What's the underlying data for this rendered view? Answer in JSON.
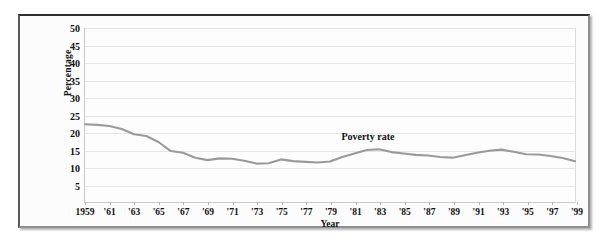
{
  "chart_data": {
    "type": "line",
    "title": "",
    "xlabel": "Year",
    "ylabel": "Percentage",
    "xlim": [
      1959,
      1999
    ],
    "ylim": [
      0,
      50
    ],
    "grid": true,
    "legend_position": "none",
    "line_color": "#9a9a9a",
    "annotations": [
      {
        "text": "Poverty rate",
        "x": 1982,
        "y": 18.5
      }
    ],
    "ytick_labels": [
      "5",
      "10",
      "15",
      "20",
      "25",
      "30",
      "35",
      "40",
      "45",
      "50"
    ],
    "yticks": [
      5,
      10,
      15,
      20,
      25,
      30,
      35,
      40,
      45,
      50
    ],
    "xtick_labels": [
      "1959",
      "'61",
      "'63",
      "'65",
      "'67",
      "'69",
      "'71",
      "'73",
      "'75",
      "'77",
      "'79",
      "'81",
      "'83",
      "'85",
      "'87",
      "'89",
      "'91",
      "'93",
      "'95",
      "'97",
      "'99"
    ],
    "xticks": [
      1959,
      1961,
      1963,
      1965,
      1967,
      1969,
      1971,
      1973,
      1975,
      1977,
      1979,
      1981,
      1983,
      1985,
      1987,
      1989,
      1991,
      1993,
      1995,
      1997,
      1999
    ],
    "series": [
      {
        "name": "Poverty rate",
        "x": [
          1959,
          1960,
          1961,
          1962,
          1963,
          1964,
          1965,
          1966,
          1967,
          1968,
          1969,
          1970,
          1971,
          1972,
          1973,
          1974,
          1975,
          1976,
          1977,
          1978,
          1979,
          1980,
          1981,
          1982,
          1983,
          1984,
          1985,
          1986,
          1987,
          1988,
          1989,
          1990,
          1991,
          1992,
          1993,
          1994,
          1995,
          1996,
          1997,
          1998,
          1999
        ],
        "values": [
          22.4,
          22.2,
          21.9,
          21.0,
          19.5,
          19.0,
          17.3,
          14.7,
          14.2,
          12.8,
          12.1,
          12.6,
          12.5,
          11.9,
          11.1,
          11.2,
          12.3,
          11.8,
          11.6,
          11.4,
          11.7,
          13.0,
          14.0,
          15.0,
          15.2,
          14.4,
          14.0,
          13.6,
          13.4,
          13.0,
          12.8,
          13.5,
          14.2,
          14.8,
          15.1,
          14.5,
          13.8,
          13.7,
          13.3,
          12.7,
          11.8
        ]
      }
    ]
  }
}
